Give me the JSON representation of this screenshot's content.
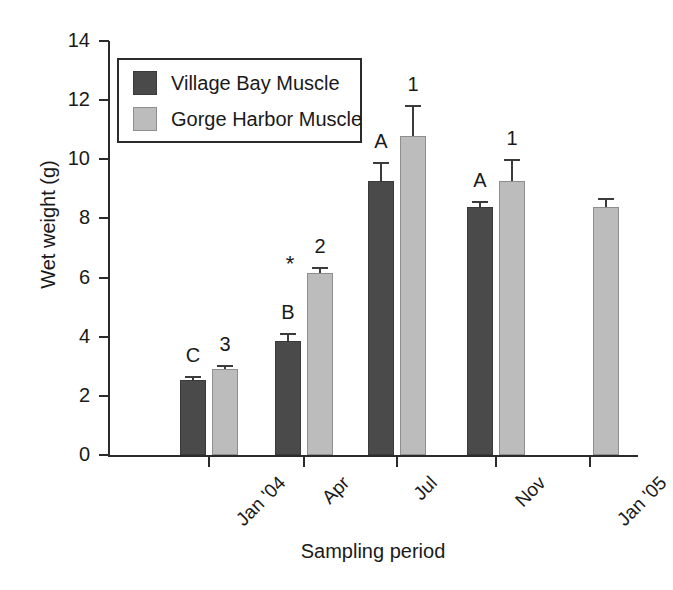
{
  "chart_data": {
    "type": "bar",
    "title": "",
    "xlabel": "Sampling period",
    "ylabel": "Wet weight (g)",
    "categories": [
      "Jan '04",
      "Apr",
      "Jul",
      "Nov",
      "Jan '05"
    ],
    "ylim": [
      0,
      14
    ],
    "yticks": [
      0,
      2,
      4,
      6,
      8,
      10,
      12,
      14
    ],
    "ytick_labels": [
      "0",
      "2",
      "4",
      "6",
      "8",
      "10",
      "12",
      "14"
    ],
    "grid": false,
    "legend_position": "upper left",
    "series": [
      {
        "name": "Village Bay Muscle",
        "color": "#4a4a4a",
        "values": [
          2.55,
          3.85,
          9.25,
          8.4,
          null
        ],
        "errors": [
          0.12,
          0.28,
          0.65,
          0.18,
          null
        ],
        "annotations": [
          "C",
          "B",
          "A",
          "A",
          ""
        ]
      },
      {
        "name": "Gorge Harbor Muscle",
        "color": "#bcbcbc",
        "values": [
          2.9,
          6.15,
          10.8,
          9.25,
          8.4
        ],
        "errors": [
          0.15,
          0.22,
          1.05,
          0.75,
          0.3
        ],
        "annotations": [
          "3",
          "2",
          "1",
          "1",
          ""
        ]
      }
    ],
    "extra_annotations": [
      {
        "text": "*",
        "category": "Apr",
        "series": "Village Bay Muscle"
      }
    ]
  },
  "legend": {
    "items": [
      {
        "label": "Village Bay Muscle",
        "swatch": "dark"
      },
      {
        "label": "Gorge Harbor Muscle",
        "swatch": "light"
      }
    ]
  },
  "axes": {
    "y_title": "Wet weight (g)",
    "x_title": "Sampling period"
  },
  "colors": {
    "village_bay": "#4a4a4a",
    "gorge_harbor": "#bcbcbc",
    "axis": "#2b2b2b"
  }
}
